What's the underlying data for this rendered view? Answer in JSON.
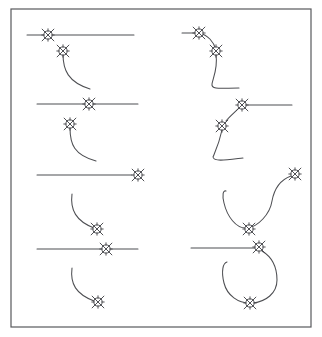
{
  "figure": {
    "width": 322,
    "height": 337,
    "background_color": "#ffffff",
    "stroke_color": "#4d4e52",
    "frame_color": "#58595c",
    "marker_color": "#46474b",
    "marker_name": "star-in-circle-node-marker",
    "frame": {
      "x": 11,
      "y": 9,
      "width": 300,
      "height": 318
    },
    "panels": [
      {
        "id": "panel-1",
        "row": 1,
        "column": "left",
        "description": "Horizontal line with node marker near left end; separate node marker below with curve descending to the right",
        "lines": [
          {
            "name": "horizontal-line",
            "x1": 27,
            "y1": 35,
            "x2": 134,
            "y2": 35
          }
        ],
        "curves": [
          {
            "name": "descending-curve",
            "path": "M 63,54 C 63,70 68,82 90,89"
          }
        ],
        "markers": [
          {
            "name": "node-marker-on-line",
            "x": 48,
            "y": 35
          },
          {
            "name": "node-marker-curve-start",
            "x": 63,
            "y": 51
          }
        ]
      },
      {
        "id": "panel-2",
        "row": 1,
        "column": "right",
        "description": "Short line into node marker, then S-curve down through second marker and trailing right",
        "lines": [
          {
            "name": "horizontal-line",
            "x1": 182,
            "y1": 33,
            "x2": 199,
            "y2": 33
          }
        ],
        "curves": [
          {
            "name": "connector-curve",
            "path": "M 199,33 C 208,35 214,42 216,50"
          },
          {
            "name": "descending-curve",
            "path": "M 216,55 C 218,68 213,78 212,84 C 211,90 222,88 239,88"
          }
        ],
        "markers": [
          {
            "name": "node-marker-on-line",
            "x": 199,
            "y": 33
          },
          {
            "name": "node-marker-curve-mid",
            "x": 216,
            "y": 51
          }
        ]
      },
      {
        "id": "panel-3",
        "row": 2,
        "column": "left",
        "description": "Horizontal line with node marker at center; below, node marker with curve descending to the right",
        "lines": [
          {
            "name": "horizontal-line",
            "x1": 37,
            "y1": 104,
            "x2": 138,
            "y2": 104
          }
        ],
        "curves": [
          {
            "name": "descending-curve",
            "path": "M 70,128 C 70,144 74,155 96,161"
          }
        ],
        "markers": [
          {
            "name": "node-marker-on-line",
            "x": 89,
            "y": 104
          },
          {
            "name": "node-marker-curve-start",
            "x": 70,
            "y": 124
          }
        ]
      },
      {
        "id": "panel-4",
        "row": 2,
        "column": "right",
        "description": "Node marker on line extending right; curve descends left to a second marker and sweeps down right",
        "lines": [
          {
            "name": "horizontal-line",
            "x1": 243,
            "y1": 105,
            "x2": 292,
            "y2": 105
          }
        ],
        "curves": [
          {
            "name": "connector-curve",
            "path": "M 240,107 C 235,112 229,117 226,121"
          },
          {
            "name": "descending-curve",
            "path": "M 222,130 C 219,144 215,152 213,157 C 214,162 226,160 243,158"
          }
        ],
        "markers": [
          {
            "name": "node-marker-on-line",
            "x": 242,
            "y": 105
          },
          {
            "name": "node-marker-curve-mid",
            "x": 222,
            "y": 126
          }
        ]
      },
      {
        "id": "panel-5",
        "row": 3,
        "column": "left",
        "description": "Horizontal line with node marker at right end; below, a curve descending to a node marker",
        "lines": [
          {
            "name": "horizontal-line",
            "x1": 37,
            "y1": 175,
            "x2": 132,
            "y2": 175
          }
        ],
        "curves": [
          {
            "name": "descending-curve",
            "path": "M 72,194 C 70,210 76,221 94,228"
          }
        ],
        "markers": [
          {
            "name": "node-marker-on-line",
            "x": 138,
            "y": 175
          },
          {
            "name": "node-marker-curve-end",
            "x": 97,
            "y": 229
          }
        ]
      },
      {
        "id": "panel-6",
        "row": 3,
        "column": "right",
        "description": "Node marker upper right with S-curve sweeping down and around to a lower node marker, then up left",
        "lines": [],
        "curves": [
          {
            "name": "s-curve",
            "path": "M 291,176 C 280,180 274,190 272,201 C 270,214 258,227 247,228 C 236,229 227,216 224,203 C 222,195 223,190 226,191"
          }
        ],
        "markers": [
          {
            "name": "node-marker-top",
            "x": 295,
            "y": 174
          },
          {
            "name": "node-marker-bottom",
            "x": 249,
            "y": 229
          }
        ]
      },
      {
        "id": "panel-7",
        "row": 4,
        "column": "left",
        "description": "Horizontal line with node marker at center; below, curve descending to a node marker",
        "lines": [
          {
            "name": "horizontal-line",
            "x1": 37,
            "y1": 249,
            "x2": 138,
            "y2": 249
          }
        ],
        "curves": [
          {
            "name": "descending-curve",
            "path": "M 72,268 C 70,284 76,294 94,301"
          }
        ],
        "markers": [
          {
            "name": "node-marker-on-line",
            "x": 106,
            "y": 249
          },
          {
            "name": "node-marker-curve-end",
            "x": 98,
            "y": 302
          }
        ]
      },
      {
        "id": "panel-8",
        "row": 4,
        "column": "right",
        "description": "Horizontal line ending at node marker with a large loop curving down and around to a lower node marker",
        "lines": [
          {
            "name": "horizontal-line",
            "x1": 191,
            "y1": 248,
            "x2": 259,
            "y2": 248
          }
        ],
        "curves": [
          {
            "name": "loop-curve",
            "path": "M 262,251 C 272,257 277,268 277,280 C 277,293 266,302 252,303 C 238,304 227,295 224,283 C 221,271 223,263 227,262"
          }
        ],
        "markers": [
          {
            "name": "node-marker-on-line",
            "x": 259,
            "y": 247
          },
          {
            "name": "node-marker-bottom",
            "x": 250,
            "y": 303
          }
        ]
      }
    ]
  }
}
